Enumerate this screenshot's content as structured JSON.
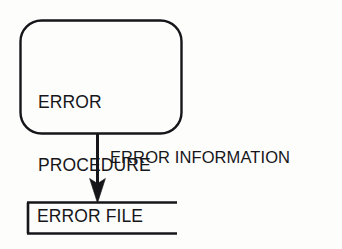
{
  "diagram": {
    "type": "flowchart",
    "background_color": "#fdfdfb",
    "stroke_color": "#16161a",
    "text_color": "#16161a",
    "nodes": [
      {
        "id": "error-procedure",
        "shape": "rounded-rectangle",
        "label_line_1": "ERROR",
        "label_line_2": "PROCEDURE"
      },
      {
        "id": "error-file",
        "shape": "open-ended-rectangle",
        "label": "ERROR FILE"
      }
    ],
    "edges": [
      {
        "id": "error-information",
        "from": "error-procedure",
        "to": "error-file",
        "direction": "down",
        "arrowhead": "solid-triangle",
        "label": "ERROR INFORMATION"
      }
    ]
  }
}
